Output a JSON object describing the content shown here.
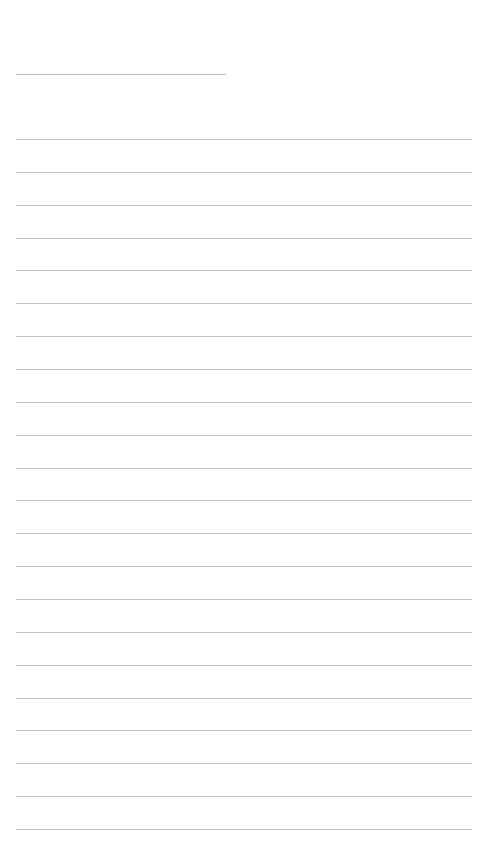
{
  "page": {
    "type": "blank-lined-sheet",
    "background_color": "#ffffff",
    "line_color": "#c4c4c4",
    "header_line": {
      "left": 16,
      "top": 74,
      "width": 210
    },
    "ruled_lines": {
      "count": 22,
      "first_top": 139,
      "spacing": 32.86,
      "left": 16,
      "width": 456
    }
  }
}
